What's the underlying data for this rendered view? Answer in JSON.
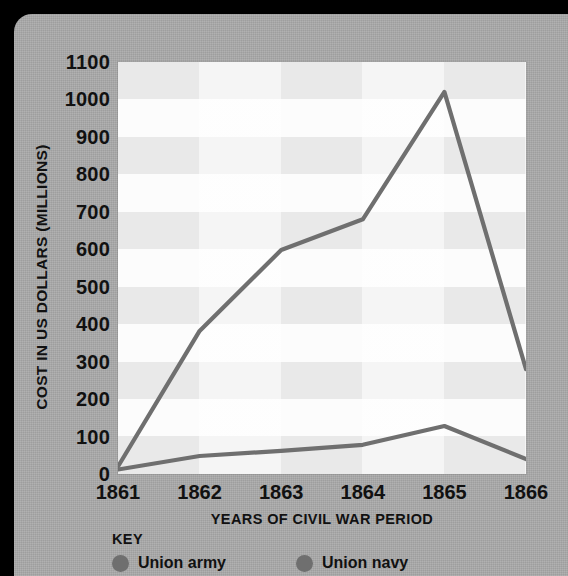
{
  "panel": {
    "background_color": "#a9a9a9",
    "outer_background_color": "#000000"
  },
  "chart_data": {
    "type": "line",
    "title": "",
    "xlabel": "YEARS OF CIVIL WAR PERIOD",
    "ylabel": "COST IN US DOLLARS (MILLIONS)",
    "categories": [
      "1861",
      "1862",
      "1863",
      "1864",
      "1865",
      "1866"
    ],
    "x": [
      1861,
      1862,
      1863,
      1864,
      1865,
      1866
    ],
    "xlim": [
      1861,
      1866
    ],
    "ylim": [
      0,
      1100
    ],
    "ytick_labels": [
      "1100",
      "1000",
      "900",
      "800",
      "700",
      "600",
      "500",
      "400",
      "300",
      "200",
      "100",
      "0"
    ],
    "ytick_values": [
      1100,
      1000,
      900,
      800,
      700,
      600,
      500,
      400,
      300,
      200,
      100,
      0
    ],
    "grid": "horizontal-bands",
    "legend_position": "below-axis",
    "legend_title": "KEY",
    "series": [
      {
        "name": "Union army",
        "color": "#6f6f6f",
        "values": [
          20,
          382,
          598,
          680,
          1020,
          280
        ]
      },
      {
        "name": "Union navy",
        "color": "#6f6f6f",
        "values": [
          12,
          48,
          62,
          78,
          128,
          40
        ]
      }
    ]
  },
  "axis": {
    "y_title": "COST IN US DOLLARS (MILLIONS)",
    "x_title": "YEARS OF CIVIL WAR PERIOD"
  },
  "key": {
    "title": "KEY",
    "items": [
      {
        "label": "Union army",
        "marker": "filled-circle",
        "color": "#6f6f6f"
      },
      {
        "label": "Union navy",
        "marker": "filled-circle",
        "color": "#6f6f6f"
      }
    ]
  }
}
